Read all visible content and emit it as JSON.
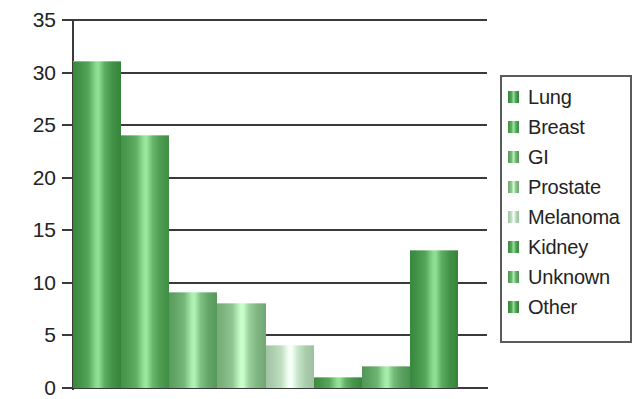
{
  "chart_data": {
    "type": "bar",
    "title": "",
    "subtitle": "",
    "xlabel": "",
    "ylabel": "",
    "categories": [
      "Lung",
      "Breast",
      "GI",
      "Prostate",
      "Melanoma",
      "Kidney",
      "Unknown",
      "Other"
    ],
    "values": [
      31,
      24,
      9,
      8,
      4,
      1,
      2,
      13
    ],
    "ylim": [
      0,
      35
    ],
    "xlim": [
      0,
      8
    ],
    "y_ticks": [
      0,
      5,
      10,
      15,
      20,
      25,
      30,
      35
    ],
    "y_tick_labels": [
      "0",
      "5",
      "10",
      "15",
      "20",
      "25",
      "30",
      "35"
    ],
    "x_tick_labels": [],
    "grid": "horizontal",
    "legend_position": "right",
    "legend_entries": [
      {
        "label": "Lung",
        "value": 31,
        "color": "#4a9a4f"
      },
      {
        "label": "Breast",
        "value": 24,
        "color": "#56a35a"
      },
      {
        "label": "GI",
        "value": 9,
        "color": "#6cae6f"
      },
      {
        "label": "Prostate",
        "value": 8,
        "color": "#86bd88"
      },
      {
        "label": "Melanoma",
        "value": 4,
        "color": "#b5d6b6"
      },
      {
        "label": "Kidney",
        "value": 1,
        "color": "#4f9d53"
      },
      {
        "label": "Unknown",
        "value": 2,
        "color": "#63a967"
      },
      {
        "label": "Other",
        "value": 13,
        "color": "#4a9a4f"
      }
    ],
    "colors": {
      "axis": "#3a3a3a",
      "gridline": "#3a3a3a",
      "text": "#232323",
      "background": "#ffffff",
      "legend_border": "#5b5b5b",
      "bar_green_dark": "#3f8c45",
      "bar_green_mid": "#63a967",
      "bar_green_light": "#c3dec4"
    }
  }
}
